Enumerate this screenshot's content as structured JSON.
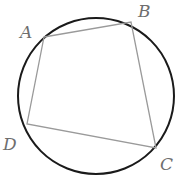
{
  "diagram": {
    "type": "cyclic-quadrilateral",
    "colors": {
      "circle": "#1a1a1a",
      "edges": "#9a9a9a",
      "labels": "#6e6e6e"
    },
    "circle": {
      "cx": 96,
      "cy": 96,
      "r": 78
    },
    "vertices": [
      {
        "name": "A",
        "x": 44,
        "y": 37,
        "label_x": 20,
        "label_y": 38
      },
      {
        "name": "B",
        "x": 131,
        "y": 22,
        "label_x": 138,
        "label_y": 17
      },
      {
        "name": "C",
        "x": 156,
        "y": 148,
        "label_x": 160,
        "label_y": 170
      },
      {
        "name": "D",
        "x": 27,
        "y": 124,
        "label_x": 3,
        "label_y": 150
      }
    ],
    "edges": [
      [
        "A",
        "B"
      ],
      [
        "B",
        "C"
      ],
      [
        "C",
        "D"
      ],
      [
        "D",
        "A"
      ]
    ]
  }
}
